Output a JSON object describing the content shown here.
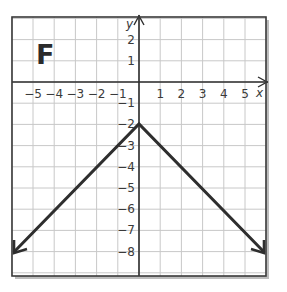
{
  "panel": {
    "label": "F"
  },
  "axes": {
    "x_label": "x",
    "y_label": "y",
    "x_ticks": [
      "−5",
      "−4",
      "−3",
      "−2",
      "−1",
      "1",
      "2",
      "3",
      "4",
      "5"
    ],
    "y_ticks": [
      "2",
      "1",
      "−1",
      "−2",
      "−3",
      "−4",
      "−5",
      "−6",
      "−7",
      "−8"
    ]
  },
  "graph": {
    "type": "absolute-value",
    "vertex": [
      0,
      -2
    ],
    "endpoints": [
      [
        -6,
        -8
      ],
      [
        6,
        -8
      ]
    ],
    "x_range": [
      -6,
      6
    ],
    "y_range": [
      -9,
      3
    ],
    "grid": true,
    "line_color": "#2e2e2e",
    "grid_color": "#c8c8c8",
    "frame_color": "#3a3a3a"
  }
}
